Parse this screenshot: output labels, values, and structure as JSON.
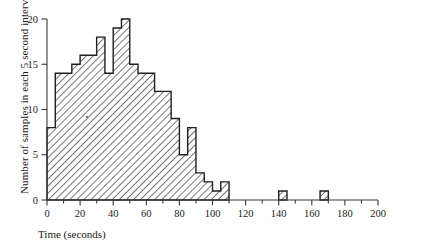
{
  "chart_data": {
    "type": "bar",
    "title": "",
    "subtitle": "",
    "xlabel": "Time (seconds)",
    "ylabel": "Number of samples in each 5 second interval",
    "bin_width": 5,
    "xlim": [
      0,
      200
    ],
    "ylim": [
      0,
      20
    ],
    "grid": false,
    "legend": null,
    "xticks": [
      0,
      20,
      40,
      60,
      80,
      100,
      120,
      140,
      160,
      180,
      200
    ],
    "xticklabels": [
      "0",
      "20",
      "40",
      "60",
      "80",
      "100",
      "120",
      "140",
      "160",
      "180",
      "200"
    ],
    "xminorticks": [
      10,
      30,
      50,
      70,
      90,
      110,
      130,
      150,
      170,
      190
    ],
    "yticks": [
      0,
      5,
      10,
      15,
      20
    ],
    "yticklabels": [
      "0",
      "5",
      "10",
      "15",
      "20"
    ],
    "bin_starts": [
      0,
      5,
      10,
      15,
      20,
      25,
      30,
      35,
      40,
      45,
      50,
      55,
      60,
      65,
      70,
      75,
      80,
      85,
      90,
      95,
      100,
      105,
      140,
      165
    ],
    "values": [
      8,
      14,
      14,
      15,
      16,
      16,
      18,
      14,
      14,
      19,
      20,
      19,
      15,
      14,
      14,
      12,
      12,
      9,
      8,
      5,
      5,
      8,
      3,
      2,
      1,
      1,
      2,
      1,
      1
    ],
    "bars": [
      {
        "x0": 0,
        "x1": 5,
        "y": 8
      },
      {
        "x0": 5,
        "x1": 10,
        "y": 14
      },
      {
        "x0": 10,
        "x1": 15,
        "y": 14
      },
      {
        "x0": 15,
        "x1": 20,
        "y": 15
      },
      {
        "x0": 20,
        "x1": 25,
        "y": 16
      },
      {
        "x0": 25,
        "x1": 30,
        "y": 16
      },
      {
        "x0": 30,
        "x1": 35,
        "y": 18
      },
      {
        "x0": 35,
        "x1": 40,
        "y": 14
      },
      {
        "x0": 40,
        "x1": 45,
        "y": 19
      },
      {
        "x0": 45,
        "x1": 50,
        "y": 20
      },
      {
        "x0": 50,
        "x1": 55,
        "y": 15
      },
      {
        "x0": 55,
        "x1": 60,
        "y": 14
      },
      {
        "x0": 60,
        "x1": 65,
        "y": 14
      },
      {
        "x0": 65,
        "x1": 70,
        "y": 12
      },
      {
        "x0": 70,
        "x1": 75,
        "y": 12
      },
      {
        "x0": 75,
        "x1": 80,
        "y": 9
      },
      {
        "x0": 80,
        "x1": 85,
        "y": 5
      },
      {
        "x0": 85,
        "x1": 90,
        "y": 8
      },
      {
        "x0": 90,
        "x1": 95,
        "y": 3
      },
      {
        "x0": 95,
        "x1": 100,
        "y": 2
      },
      {
        "x0": 100,
        "x1": 105,
        "y": 1
      },
      {
        "x0": 105,
        "x1": 110,
        "y": 2
      },
      {
        "x0": 140,
        "x1": 145,
        "y": 1
      },
      {
        "x0": 165,
        "x1": 170,
        "y": 1
      }
    ]
  }
}
